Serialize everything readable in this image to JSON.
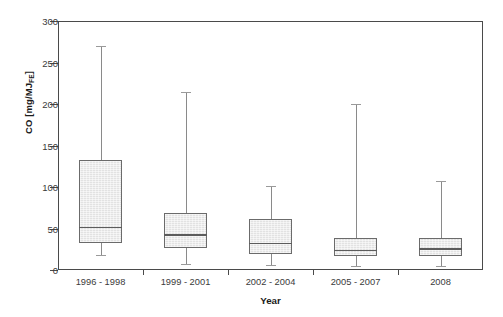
{
  "chart_data": {
    "type": "box",
    "title": "",
    "xlabel": "Year",
    "ylabel_text": "CO [mg/MJ",
    "ylabel_sub": "FE",
    "ylabel_tail": "]",
    "ylabel_full": "CO [mg/MJFE]",
    "ylim": [
      0,
      300
    ],
    "yticks": [
      0,
      50,
      100,
      150,
      200,
      250,
      300
    ],
    "ytick_labels": [
      "0",
      "50",
      "100",
      "150",
      "200",
      "250",
      "300"
    ],
    "grid": false,
    "legend": "none",
    "categories": [
      "1996 - 1998",
      "1999 - 2001",
      "2002 - 2004",
      "2005 - 2007",
      "2008"
    ],
    "boxes": [
      {
        "label": "1996 - 1998",
        "whisker_low": 18,
        "q1": 33,
        "median": 52,
        "q3": 133,
        "whisker_high": 270
      },
      {
        "label": "1999 - 2001",
        "whisker_low": 7,
        "q1": 26,
        "median": 43,
        "q3": 69,
        "whisker_high": 215
      },
      {
        "label": "2002 - 2004",
        "whisker_low": 6,
        "q1": 19,
        "median": 33,
        "q3": 61,
        "whisker_high": 101
      },
      {
        "label": "2005 - 2007",
        "whisker_low": 5,
        "q1": 17,
        "median": 24,
        "q3": 38,
        "whisker_high": 200
      },
      {
        "label": "2008",
        "whisker_low": 5,
        "q1": 17,
        "median": 26,
        "q3": 39,
        "whisker_high": 107
      }
    ],
    "colors": {
      "box_fill": "#e2e2e2",
      "box_edge": "#6b6b6b",
      "median": "#5c5c5c",
      "whisker": "#8a8a8a",
      "frame": "#4a4a4a",
      "text": "#3a3a3a",
      "background": "#ffffff"
    }
  }
}
